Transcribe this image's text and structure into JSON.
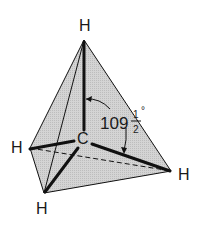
{
  "diagram": {
    "atoms": {
      "top": "H",
      "left": "H",
      "bottom": "H",
      "right": "H",
      "center": "C"
    },
    "angle": {
      "whole": "109",
      "numerator": "1",
      "denominator": "2",
      "unit": "°"
    },
    "colors": {
      "face_fill": "#c8c8c8",
      "line": "#111111",
      "background": "#ffffff"
    }
  }
}
